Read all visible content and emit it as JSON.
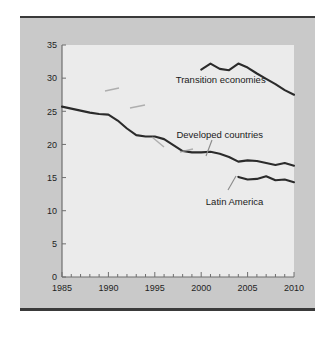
{
  "figure": {
    "caption_fragment": "",
    "panel_bg": "#c9c9c9",
    "plot_bg": "#ebebeb",
    "line_color": "#2b2b2b",
    "rule_color": "#3a3a3a"
  },
  "chart_data": {
    "type": "line",
    "title": "",
    "xlabel": "",
    "ylabel": "",
    "xlim": [
      1985,
      2010
    ],
    "ylim": [
      0,
      35
    ],
    "grid": false,
    "legend_position": "inline-annotations",
    "xticks": [
      1985,
      1990,
      1995,
      2000,
      2005,
      2010
    ],
    "xtick_labels": [
      "1985",
      "1990",
      "1995",
      "2000",
      "2005",
      "2010"
    ],
    "minor_xtick_step": 1,
    "yticks": [
      0,
      5,
      10,
      15,
      20,
      25,
      30,
      35
    ],
    "ytick_labels": [
      "0",
      "5",
      "10",
      "15",
      "20",
      "25",
      "30",
      "35"
    ],
    "series": [
      {
        "name": "Developed countries",
        "x": [
          1985,
          1986,
          1987,
          1988,
          1989,
          1990,
          1991,
          1992,
          1993,
          1994,
          1995,
          1996,
          1997,
          1998,
          1999,
          2000,
          2001,
          2002,
          2003,
          2004,
          2005,
          2006,
          2007,
          2008,
          2009,
          2010
        ],
        "values": [
          25.7,
          25.4,
          25.1,
          24.8,
          24.6,
          24.5,
          23.6,
          22.4,
          21.4,
          21.2,
          21.2,
          20.8,
          19.9,
          19.0,
          18.8,
          18.8,
          18.9,
          18.6,
          18.1,
          17.4,
          17.6,
          17.5,
          17.2,
          16.9,
          17.2,
          16.8
        ]
      },
      {
        "name": "Transition economies",
        "x": [
          2000,
          2001,
          2002,
          2003,
          2004,
          2005,
          2006,
          2007,
          2008,
          2009,
          2010
        ],
        "values": [
          31.3,
          32.2,
          31.4,
          31.2,
          32.2,
          31.6,
          30.7,
          29.9,
          29.1,
          28.2,
          27.5
        ]
      },
      {
        "name": "Latin America",
        "x": [
          2004,
          2005,
          2006,
          2007,
          2008,
          2009,
          2010
        ],
        "values": [
          15.1,
          14.7,
          14.8,
          15.2,
          14.6,
          14.7,
          14.3
        ]
      }
    ],
    "annotations": [
      {
        "text": "Transition economies",
        "x": 2002.1,
        "y": 29.3,
        "leader": false
      },
      {
        "text": "Developed countries",
        "x": 2002.0,
        "y": 20.9,
        "leader": true
      },
      {
        "text": "Latin America",
        "x": 2003.6,
        "y": 10.9,
        "leader": true
      }
    ]
  }
}
